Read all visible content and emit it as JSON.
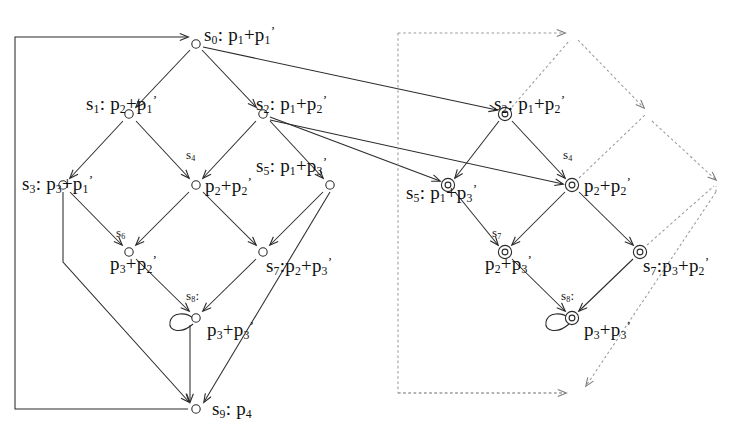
{
  "figure": {
    "stroke_solid": "#2b2b2b",
    "stroke_dashed": "#9a9a9a",
    "background": "#ffffff"
  },
  "left_graph": {
    "name": "solid-state-graph",
    "node_style": "open-circle",
    "nodes": [
      {
        "id": "s0",
        "state": "s",
        "index": "0",
        "sep": ":",
        "expr_a": "p",
        "sub_a": "1",
        "expr_b": "p",
        "sub_b": "1",
        "prime": "′",
        "label": "s0: p1+p1'",
        "x": 196,
        "y": 44
      },
      {
        "id": "s1",
        "state": "s",
        "index": "1",
        "sep": ":",
        "expr_a": "p",
        "sub_a": "2",
        "expr_b": "p",
        "sub_b": "1",
        "prime": "′",
        "label": "s1: p2+p1'",
        "x": 129,
        "y": 114
      },
      {
        "id": "s2",
        "state": "s",
        "index": "2",
        "sep": ":",
        "expr_a": "p",
        "sub_a": "1",
        "expr_b": "p",
        "sub_b": "2",
        "prime": "′",
        "label": "s2: p1+p2'",
        "x": 263,
        "y": 114
      },
      {
        "id": "s3",
        "state": "s",
        "index": "3",
        "sep": ":",
        "expr_a": "p",
        "sub_a": "3",
        "expr_b": "p",
        "sub_b": "1",
        "prime": "′",
        "label": "s3: p3+p1'",
        "x": 63,
        "y": 185
      },
      {
        "id": "s4",
        "state": "s",
        "index": "4",
        "sep": "",
        "expr_a": "p",
        "sub_a": "2",
        "expr_b": "p",
        "sub_b": "2",
        "prime": "′",
        "label": "s4: p2+p2'",
        "x": 196,
        "y": 185
      },
      {
        "id": "s5",
        "state": "s",
        "index": "5",
        "sep": ":",
        "expr_a": "p",
        "sub_a": "1",
        "expr_b": "p",
        "sub_b": "3",
        "prime": "′",
        "label": "s5: p1+p3'",
        "x": 330,
        "y": 185
      },
      {
        "id": "s6",
        "state": "s",
        "index": "6",
        "sep": "",
        "expr_a": "p",
        "sub_a": "3",
        "expr_b": "p",
        "sub_b": "2",
        "prime": "′",
        "label": "s6: p3+p2'",
        "x": 129,
        "y": 252
      },
      {
        "id": "s7",
        "state": "s",
        "index": "7",
        "sep": ":",
        "expr_a": "p",
        "sub_a": "2",
        "expr_b": "p",
        "sub_b": "3",
        "prime": "′",
        "label": "s7: p2+p3'",
        "x": 263,
        "y": 252
      },
      {
        "id": "s8",
        "state": "s",
        "index": "8",
        "sep": ":",
        "expr_a": "p",
        "sub_a": "3",
        "expr_b": "p",
        "sub_b": "3",
        "prime": "′",
        "label": "s8: p3+p3'",
        "x": 196,
        "y": 318
      },
      {
        "id": "s9",
        "state": "s",
        "index": "9",
        "sep": ":",
        "expr_a": "p",
        "sub_a": "4",
        "expr_b": "",
        "sub_b": "",
        "prime": "",
        "label": "s9: p4",
        "x": 196,
        "y": 409
      }
    ],
    "labels": [
      {
        "for": "s0",
        "text": "s0: p1+p1'",
        "x": 204,
        "y": 24
      },
      {
        "for": "s1",
        "text": "s1: p2+p1'",
        "x": 86,
        "y": 93
      },
      {
        "for": "s2",
        "text": "s2: p1+p2'",
        "x": 258,
        "y": 93
      },
      {
        "for": "s3",
        "text": "s3: p3+p1'",
        "x": 22,
        "y": 173
      },
      {
        "for": "s4tag",
        "text": "s4",
        "x": 188,
        "y": 150
      },
      {
        "for": "s4expr",
        "text": "p2+p2'",
        "x": 205,
        "y": 175
      },
      {
        "for": "s5",
        "text": "s5: p1+p3'",
        "x": 258,
        "y": 155
      },
      {
        "for": "s6tag",
        "text": "s6",
        "x": 117,
        "y": 228
      },
      {
        "for": "s6expr",
        "text": "p3+p2'",
        "x": 112,
        "y": 253
      },
      {
        "for": "s7",
        "text": "s7:p2+p3'",
        "x": 268,
        "y": 255
      },
      {
        "for": "s8tag",
        "text": "s8:",
        "x": 188,
        "y": 292
      },
      {
        "for": "s8expr",
        "text": "p3+p3'",
        "x": 208,
        "y": 320
      },
      {
        "for": "s9",
        "text": "s9: p4",
        "x": 213,
        "y": 400
      }
    ],
    "self_loop_node": "s8",
    "feedback_edge": {
      "from": "s9",
      "to": "s0",
      "path": "left-side wrap-around"
    },
    "edges": [
      {
        "from": "s0",
        "to": "s1"
      },
      {
        "from": "s0",
        "to": "s2"
      },
      {
        "from": "s1",
        "to": "s3"
      },
      {
        "from": "s1",
        "to": "s4"
      },
      {
        "from": "s2",
        "to": "s4"
      },
      {
        "from": "s2",
        "to": "s5"
      },
      {
        "from": "s3",
        "to": "s6"
      },
      {
        "from": "s4",
        "to": "s6"
      },
      {
        "from": "s4",
        "to": "s7"
      },
      {
        "from": "s5",
        "to": "s7"
      },
      {
        "from": "s6",
        "to": "s8"
      },
      {
        "from": "s7",
        "to": "s8"
      },
      {
        "from": "s3",
        "to": "s9"
      },
      {
        "from": "s8",
        "to": "s9"
      },
      {
        "from": "s5",
        "to": "s9"
      },
      {
        "from": "s8",
        "to": "s8"
      }
    ]
  },
  "right_graph": {
    "name": "dashed-state-graph",
    "node_style": "double-circle",
    "nodes": [
      {
        "id": "r2",
        "label": "s2: p1+p2'",
        "x": 505,
        "y": 114
      },
      {
        "id": "r5",
        "label": "s5: p1+p3'",
        "x": 448,
        "y": 185
      },
      {
        "id": "r4",
        "label": "s4: p2+p2'",
        "x": 572,
        "y": 185
      },
      {
        "id": "r7a",
        "label": "s7: p2+p3'",
        "x": 505,
        "y": 252
      },
      {
        "id": "r7b",
        "label": "s7:p3+p2'",
        "x": 640,
        "y": 252
      },
      {
        "id": "r8",
        "label": "s8: p3+p3'",
        "x": 572,
        "y": 318
      }
    ],
    "labels": [
      {
        "for": "r2",
        "text": "s2: p1+p2'",
        "x": 495,
        "y": 93
      },
      {
        "for": "r5",
        "text": "s5: p1+p3'",
        "x": 408,
        "y": 182
      },
      {
        "for": "r4tag",
        "text": "s4",
        "x": 566,
        "y": 150
      },
      {
        "for": "r4expr",
        "text": "p2+p2'",
        "x": 584,
        "y": 175
      },
      {
        "for": "r7atag",
        "text": "s7",
        "x": 494,
        "y": 228
      },
      {
        "for": "r7aexpr",
        "text": "p2+p3'",
        "x": 487,
        "y": 253
      },
      {
        "for": "r7b",
        "text": "s7:p3+p2'",
        "x": 645,
        "y": 255
      },
      {
        "for": "r8tag",
        "text": "s8:",
        "x": 563,
        "y": 292
      },
      {
        "for": "r8expr",
        "text": "p3+p3'",
        "x": 585,
        "y": 320
      }
    ],
    "self_loop_node": "r8",
    "dashed_box": {
      "x": 398,
      "y": 33,
      "width": 176,
      "height": 360
    },
    "solid_cross_edges": [
      {
        "from": "s0",
        "to": "r2"
      },
      {
        "from": "s2",
        "to": "r5"
      },
      {
        "from": "s2",
        "to": "r4"
      }
    ],
    "dashed_edges": [
      {
        "from": "box-top-left",
        "to": "apex"
      },
      {
        "from": "apex",
        "to": "r4-upper-right"
      },
      {
        "from": "r4-upper-right",
        "to": "r7b-right"
      },
      {
        "from": "r7b-right",
        "to": "sink"
      },
      {
        "from": "box-bottom-left",
        "to": "sink"
      }
    ],
    "edges": [
      {
        "from": "r2",
        "to": "r5"
      },
      {
        "from": "r2",
        "to": "r4"
      },
      {
        "from": "r5",
        "to": "r7a"
      },
      {
        "from": "r4",
        "to": "r7a"
      },
      {
        "from": "r4",
        "to": "r7b"
      },
      {
        "from": "r7a",
        "to": "r8"
      },
      {
        "from": "r7b",
        "to": "r8"
      },
      {
        "from": "r8",
        "to": "r8"
      }
    ]
  }
}
